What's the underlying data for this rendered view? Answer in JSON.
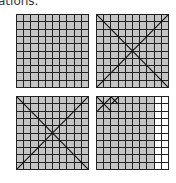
{
  "caption": "ations.",
  "grids": [
    {
      "id": "g1",
      "rows": 10,
      "cols": 10,
      "shaded_cells": 100,
      "white_columns": [],
      "marks": "none"
    },
    {
      "id": "g2",
      "rows": 10,
      "cols": 10,
      "shaded_cells": 100,
      "white_columns": [],
      "marks": "large X across whole grid"
    },
    {
      "id": "g3",
      "rows": 10,
      "cols": 10,
      "shaded_cells": 100,
      "white_columns": [],
      "marks": "large X across whole grid"
    },
    {
      "id": "g4",
      "rows": 10,
      "cols": 10,
      "shaded_cells": 80,
      "white_columns": [
        9,
        10
      ],
      "marks": "X over top-left 2x2 block and X over cell row1 col3"
    }
  ],
  "colors": {
    "shaded": "#c4c4c4",
    "line": "#222222",
    "white": "#ffffff"
  }
}
